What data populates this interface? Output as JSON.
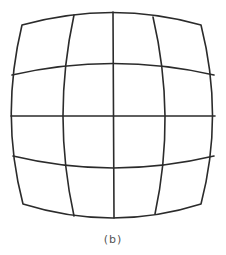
{
  "figure": {
    "caption": "(b)",
    "grid": {
      "rows": 4,
      "columns": 4
    },
    "stroke_color": "#2b2b2b",
    "background": "#ffffff",
    "paths": {
      "outline": "M22,25 Q113,0 201,25 Q224,116 201,204 Q113,232 23,204 Q0,116 22,25 Z",
      "h1": "M12,75 Q113,52 214,75",
      "h2": "M11,116 L215,116",
      "h3": "M13,156 Q113,180 214,156",
      "v1": "M74,15 Q52,116 74,216",
      "v2": "M113,12 L114,218",
      "v3": "M153,17 Q176,116 155,214"
    }
  }
}
